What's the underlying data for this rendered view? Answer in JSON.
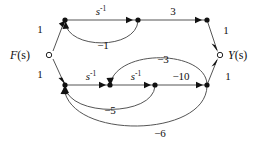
{
  "diagram": {
    "type": "signal-flow-graph",
    "background_color": "#ffffff",
    "line_color": "#555555",
    "marker_color": "#111111",
    "input": {
      "label": "F(s)",
      "label_main": "F",
      "label_arg": "(s)",
      "node_style": "open-circle",
      "x": 47,
      "y": 55
    },
    "output": {
      "label": "Y(s)",
      "label_main": "Y",
      "label_arg": "(s)",
      "node_style": "open-circle",
      "x": 222,
      "y": 55
    },
    "nodes": [
      {
        "id": "n_top_1",
        "x": 65,
        "y": 20,
        "style": "filled"
      },
      {
        "id": "n_top_2",
        "x": 138,
        "y": 20,
        "style": "filled"
      },
      {
        "id": "n_top_3",
        "x": 207,
        "y": 20,
        "style": "filled"
      },
      {
        "id": "n_bot_1",
        "x": 65,
        "y": 85,
        "style": "filled"
      },
      {
        "id": "n_bot_2",
        "x": 110,
        "y": 85,
        "style": "filled"
      },
      {
        "id": "n_bot_3",
        "x": 155,
        "y": 85,
        "style": "filled"
      },
      {
        "id": "n_bot_4",
        "x": 207,
        "y": 85,
        "style": "filled"
      }
    ],
    "edges": [
      {
        "id": "e_in_top",
        "from": "F(s)",
        "to": "n_top_1",
        "gain": "1",
        "gain_plain": "1",
        "shape": "straight",
        "label_x": 40,
        "label_y": 33
      },
      {
        "id": "e_top_1_2",
        "from": "n_top_1",
        "to": "n_top_2",
        "gain": "s^-1",
        "gain_base": "s",
        "gain_sup": "-1",
        "shape": "straight",
        "label_x": 101,
        "label_y": 15
      },
      {
        "id": "e_top_2_3",
        "from": "n_top_2",
        "to": "n_top_3",
        "gain": "3",
        "gain_plain": "3",
        "shape": "straight",
        "label_x": 173,
        "label_y": 15
      },
      {
        "id": "e_top_out",
        "from": "n_top_3",
        "to": "Y(s)",
        "gain": "1",
        "gain_plain": "1",
        "shape": "straight",
        "label_x": 224,
        "label_y": 33
      },
      {
        "id": "e_fb_minus1",
        "from": "n_top_2",
        "to": "n_top_1",
        "gain": "-1",
        "gain_plain": "−1",
        "shape": "arc-below",
        "label_x": 103,
        "label_y": 48
      },
      {
        "id": "e_in_bot",
        "from": "F(s)",
        "to": "n_bot_1",
        "gain": "1",
        "gain_plain": "1",
        "shape": "straight",
        "label_x": 40,
        "label_y": 78
      },
      {
        "id": "e_bot_1_2",
        "from": "n_bot_1",
        "to": "n_bot_2",
        "gain": "s^-1",
        "gain_base": "s",
        "gain_sup": "-1",
        "shape": "straight",
        "label_x": 91,
        "label_y": 80
      },
      {
        "id": "e_bot_2_3",
        "from": "n_bot_2",
        "to": "n_bot_3",
        "gain": "s^-1",
        "gain_base": "s",
        "gain_sup": "-1",
        "shape": "straight",
        "label_x": 136,
        "label_y": 80
      },
      {
        "id": "e_bot_3_4",
        "from": "n_bot_3",
        "to": "n_bot_4",
        "gain": "-10",
        "gain_plain": "−10",
        "shape": "straight",
        "label_x": 181,
        "label_y": 80
      },
      {
        "id": "e_bot_out",
        "from": "n_bot_4",
        "to": "Y(s)",
        "gain": "1",
        "gain_plain": "1",
        "shape": "straight",
        "label_x": 224,
        "label_y": 79
      },
      {
        "id": "e_fb_minus3",
        "from": "n_bot_4",
        "to": "n_bot_2",
        "gain": "-3",
        "gain_plain": "−3",
        "shape": "arc-above",
        "label_x": 162,
        "label_y": 62
      },
      {
        "id": "e_fb_minus5",
        "from": "n_bot_3",
        "to": "n_bot_1",
        "gain": "-5",
        "gain_plain": "−5",
        "shape": "arc-below",
        "label_x": 108,
        "label_y": 112
      },
      {
        "id": "e_fb_minus6",
        "from": "n_bot_4",
        "to": "n_bot_1",
        "gain": "-6",
        "gain_plain": "−6",
        "shape": "arc-below",
        "label_x": 157,
        "label_y": 135
      }
    ]
  }
}
